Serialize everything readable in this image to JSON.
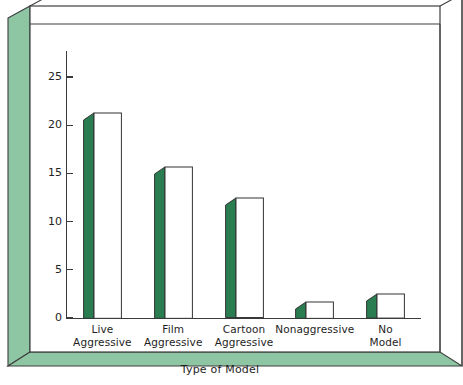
{
  "chart_data": {
    "type": "bar",
    "title": "",
    "subtitle": "",
    "xlabel": "Type of Model",
    "ylabel": "",
    "categories": [
      "Live\nAggressive",
      "Film\nAggressive",
      "Cartoon\nAggressive",
      "Nonaggressive",
      "No\nModel"
    ],
    "category_lines": [
      [
        "Live",
        "Aggressive"
      ],
      [
        "Film",
        "Aggressive"
      ],
      [
        "Cartoon",
        "Aggressive"
      ],
      [
        "Nonaggressive"
      ],
      [
        "No",
        "Model"
      ]
    ],
    "values": [
      21.3,
      15.7,
      12.4,
      1.7,
      2.5
    ],
    "ylim": [
      0,
      25
    ],
    "yticks": [
      0,
      5,
      10,
      15,
      20,
      25
    ],
    "ytick_labels": [
      "0",
      "5",
      "10",
      "15",
      "20",
      "25"
    ],
    "grid": false,
    "legend": false,
    "style": "3d-bar",
    "colors": {
      "bar_side": "#2a7d50",
      "bar_front": "#ffffff",
      "bar_outline": "#333333",
      "frame_panel": "#8ec6a4",
      "frame_edge": "#3f3f3f",
      "plot_background": "#ffffff",
      "text": "#1e1e1e"
    }
  },
  "axis": {
    "x_title": "Type of Model"
  }
}
